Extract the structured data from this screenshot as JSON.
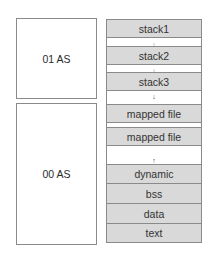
{
  "address_spaces": [
    {
      "id": "as01",
      "label": "01 AS"
    },
    {
      "id": "as00",
      "label": "00 AS"
    }
  ],
  "memory_layout": {
    "segments": [
      {
        "label": "stack1",
        "filled": true
      },
      {
        "label": "stack2",
        "filled": true
      },
      {
        "label": "stack3",
        "filled": true
      },
      {
        "label": "mapped file",
        "filled": true
      },
      {
        "label": "mapped file",
        "filled": true
      },
      {
        "label": "dynamic",
        "filled": true
      },
      {
        "label": "bss",
        "filled": true
      },
      {
        "label": "data",
        "filled": true
      },
      {
        "label": "text",
        "filled": true
      }
    ],
    "arrows": {
      "down": "↓",
      "up": "↑"
    }
  },
  "colors": {
    "segment_fill": "#d9d9d9",
    "border": "#8a8a8a"
  }
}
